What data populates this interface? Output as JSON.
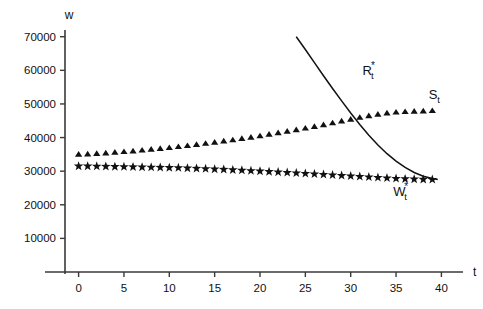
{
  "chart_data": {
    "type": "scatter",
    "title": "",
    "xlabel": "t",
    "ylabel": "w",
    "xlim": [
      -1.5,
      41.5
    ],
    "ylim": [
      0,
      72000
    ],
    "grid": false,
    "legend": "inline-labels",
    "xticks": [
      0,
      5,
      10,
      15,
      20,
      25,
      30,
      35,
      40
    ],
    "xtick_labels": [
      "0",
      "5",
      "10",
      "15",
      "20",
      "25",
      "30",
      "35",
      "40"
    ],
    "yticks": [
      10000,
      20000,
      30000,
      40000,
      50000,
      60000,
      70000
    ],
    "ytick_labels": [
      "10000",
      "20000",
      "30000",
      "40000",
      "50000",
      "60000",
      "70000"
    ],
    "series": [
      {
        "name": "S_t",
        "label_text": "S",
        "label_sub": "t",
        "label_sup": "",
        "marker": "triangle",
        "style": "markers",
        "x": [
          0,
          1,
          2,
          3,
          4,
          5,
          6,
          7,
          8,
          9,
          10,
          11,
          12,
          13,
          14,
          15,
          16,
          17,
          18,
          19,
          20,
          21,
          22,
          23,
          24,
          25,
          26,
          27,
          28,
          29,
          30,
          31,
          32,
          33,
          34,
          35,
          36,
          37,
          38,
          39
        ],
        "values": [
          35000,
          35100,
          35250,
          35400,
          35600,
          35800,
          36000,
          36250,
          36500,
          36750,
          37000,
          37300,
          37600,
          37900,
          38250,
          38600,
          38950,
          39300,
          39700,
          40100,
          40500,
          40950,
          41400,
          41850,
          42300,
          42800,
          43300,
          43800,
          44350,
          44900,
          45450,
          46000,
          46500,
          46950,
          47300,
          47550,
          47700,
          47800,
          47900,
          48000
        ]
      },
      {
        "name": "W*_t",
        "label_text": "W",
        "label_sub": "t",
        "label_sup": "*",
        "marker": "star",
        "style": "markers",
        "x": [
          0,
          1,
          2,
          3,
          4,
          5,
          6,
          7,
          8,
          9,
          10,
          11,
          12,
          13,
          14,
          15,
          16,
          17,
          18,
          19,
          20,
          21,
          22,
          23,
          24,
          25,
          26,
          27,
          28,
          29,
          30,
          31,
          32,
          33,
          34,
          35,
          36,
          37,
          38,
          39
        ],
        "values": [
          31500,
          31500,
          31450,
          31400,
          31350,
          31300,
          31250,
          31200,
          31150,
          31100,
          31050,
          31000,
          30900,
          30800,
          30700,
          30600,
          30500,
          30380,
          30250,
          30120,
          30000,
          29860,
          29720,
          29580,
          29440,
          29300,
          29150,
          29000,
          28850,
          28700,
          28550,
          28400,
          28250,
          28100,
          27950,
          27800,
          27700,
          27620,
          27550,
          27500
        ]
      },
      {
        "name": "R*_t",
        "label_text": "R",
        "label_sub": "t",
        "label_sup": "*",
        "marker": "none",
        "style": "line",
        "x": [
          24.0,
          25.0,
          26.0,
          27.0,
          28.0,
          29.0,
          30.0,
          31.0,
          32.0,
          33.0,
          34.0,
          35.0,
          36.0,
          37.0,
          38.0,
          39.0,
          39.6
        ],
        "values": [
          70000,
          66200,
          62300,
          58400,
          54600,
          50900,
          47300,
          43900,
          40700,
          37800,
          35200,
          33000,
          31100,
          29600,
          28500,
          27800,
          27500
        ]
      }
    ],
    "annotations": [
      {
        "name": "label-R",
        "text": "R*t",
        "x": 31.3,
        "y": 58500
      },
      {
        "name": "label-S",
        "text": "St",
        "x": 38.6,
        "y": 51500
      },
      {
        "name": "label-W",
        "text": "W*t",
        "x": 34.7,
        "y": 22500
      }
    ]
  }
}
